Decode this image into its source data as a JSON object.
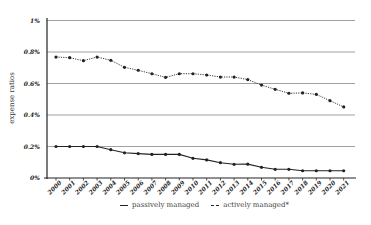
{
  "chart_data": {
    "type": "line",
    "title": "",
    "xlabel": "",
    "ylabel": "expense ratios",
    "ylim": [
      0,
      1
    ],
    "yticks": [
      "0%",
      "0.2%",
      "0.4%",
      "0.6%",
      "0.8%",
      "1%"
    ],
    "ytick_values": [
      0,
      0.2,
      0.4,
      0.6,
      0.8,
      1.0
    ],
    "grid": true,
    "legend_position": "bottom",
    "categories": [
      "2000",
      "2001",
      "2002",
      "2003",
      "2004",
      "2005",
      "2006",
      "2007",
      "2008",
      "2009",
      "2010",
      "2011",
      "2012",
      "2013",
      "2014",
      "2015",
      "2016",
      "2017",
      "2018",
      "2019",
      "2020",
      "2021"
    ],
    "series": [
      {
        "name": "passively managed",
        "style": "solid",
        "values": [
          0.2,
          0.2,
          0.2,
          0.2,
          0.18,
          0.16,
          0.155,
          0.15,
          0.15,
          0.15,
          0.125,
          0.115,
          0.097,
          0.087,
          0.088,
          0.068,
          0.055,
          0.055,
          0.046,
          0.046,
          0.046,
          0.046
        ]
      },
      {
        "name": "actively managed*",
        "style": "dotted",
        "values": [
          0.768,
          0.764,
          0.745,
          0.768,
          0.747,
          0.703,
          0.684,
          0.662,
          0.639,
          0.662,
          0.662,
          0.654,
          0.641,
          0.641,
          0.625,
          0.59,
          0.563,
          0.538,
          0.54,
          0.531,
          0.491,
          0.451
        ]
      }
    ]
  },
  "legend": {
    "passive_label": "passively managed",
    "active_label": "actively managed*"
  },
  "colors": {
    "line": "#222222",
    "grid": "#888888"
  }
}
